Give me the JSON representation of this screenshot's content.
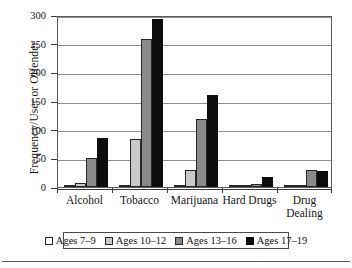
{
  "chart_data": {
    "type": "bar",
    "title": "",
    "xlabel": "",
    "ylabel": "Frequency/User or Offender",
    "ylim": [
      0,
      300
    ],
    "yticks": [
      0,
      50,
      100,
      150,
      200,
      250,
      300
    ],
    "ytick_labels": [
      "0",
      "50",
      "100",
      "150",
      "200",
      "250",
      "300"
    ],
    "grid": true,
    "grid_axis": "y",
    "legend_position": "bottom",
    "categories": [
      "Alcohol",
      "Tobacco",
      "Marijuana",
      "Hard Drugs",
      "Drug Dealing"
    ],
    "category_label_lines": [
      [
        "Alcohol"
      ],
      [
        "Tobacco"
      ],
      [
        "Marijuana"
      ],
      [
        "Hard Drugs"
      ],
      [
        "Drug",
        "Dealing"
      ]
    ],
    "series": [
      {
        "name": "Ages 7–9",
        "color": "#ffffff",
        "edge_color": "#262626",
        "values": [
          3,
          1,
          1,
          0.5,
          0
        ]
      },
      {
        "name": "Ages 10–12",
        "color": "#c9c9c9",
        "edge_color": "#262626",
        "values": [
          7,
          83,
          29,
          2,
          4
        ]
      },
      {
        "name": "Ages 13–16",
        "color": "#8a8a8a",
        "edge_color": "#262626",
        "values": [
          50,
          258,
          119,
          5,
          29
        ]
      },
      {
        "name": "Ages 17–19",
        "color": "#0d0d0d",
        "edge_color": "#0d0d0d",
        "values": [
          86,
          293,
          160,
          18,
          28
        ]
      }
    ]
  },
  "legend": {
    "items": [
      {
        "label": "Ages 7–9"
      },
      {
        "label": "Ages 10–12"
      },
      {
        "label": "Ages 13–16"
      },
      {
        "label": "Ages 17–19"
      }
    ]
  }
}
